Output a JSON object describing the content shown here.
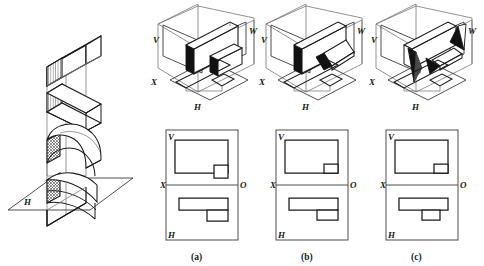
{
  "figure": {
    "type": "descriptive-geometry-plate",
    "background": "#ffffff",
    "ink": "#1a1a1a",
    "thin_ink": "#5a5a5a",
    "solid_fill": "#1a1a1a",
    "hatch_fill": "#7d7d7d"
  },
  "left_figure": {
    "name": "sectioned-prism-on-horizontal-plane",
    "description": "Tall rectangular prism cut by a series of plane and curved section surfaces, standing on horizontal plane H",
    "plane_label": "H",
    "section_count": 4,
    "section_kinds": [
      "plane-oblique",
      "plane-oblique",
      "curved-dome",
      "curved-swept"
    ]
  },
  "isometrics": [
    {
      "key": "iso-a",
      "labels": {
        "v": "V",
        "w": "W",
        "x": "X",
        "h": "H"
      },
      "solid_note": "slab with small block, end-face shaded solid black"
    },
    {
      "key": "iso-b",
      "labels": {
        "v": "V",
        "w": "W",
        "x": "X",
        "h": "H"
      },
      "solid_note": "slab with rotated block, end-face shaded solid black"
    },
    {
      "key": "iso-c",
      "labels": {
        "v": "V",
        "w": "W",
        "x": "X",
        "h": "H"
      },
      "solid_note": "slab with wedge/triangular projections shaded solid black"
    }
  ],
  "projections": [
    {
      "key": "proj-a",
      "caption": "(a)",
      "labels": {
        "v": "V",
        "h": "H",
        "x": "X",
        "o": "O"
      },
      "v_view": {
        "outer": "large rectangle",
        "notch": "small rectangle at lower right, outside bottom edge"
      },
      "h_view": {
        "outer": "wide thin rectangle",
        "notch": "small rectangle below right portion"
      }
    },
    {
      "key": "proj-b",
      "caption": "(b)",
      "labels": {
        "v": "V",
        "h": "H",
        "x": "X",
        "o": "O"
      },
      "v_view": {
        "outer": "large rectangle",
        "notch": "small rectangle at lower right, inside bottom edge"
      },
      "h_view": {
        "outer": "wide thin rectangle",
        "notch": "small rectangle below right portion"
      }
    },
    {
      "key": "proj-c",
      "caption": "(c)",
      "labels": {
        "v": "V",
        "h": "H",
        "x": "X",
        "o": "O"
      },
      "v_view": {
        "outer": "large rectangle",
        "notch": "small rectangle at lower right, inside bottom edge"
      },
      "h_view": {
        "outer": "wide thin rectangle",
        "notch": "small rectangle centered below"
      }
    }
  ],
  "captions": [
    "(a)",
    "(b)",
    "(c)"
  ]
}
